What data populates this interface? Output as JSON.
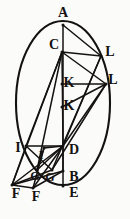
{
  "figure": {
    "kind": "geometric-diagram",
    "ink_color": "#141210",
    "paper_color": "#fbfbf9",
    "width": 130,
    "height": 219
  },
  "ellipse": {
    "cx": 63,
    "cy": 103,
    "rx": 47,
    "ry": 82
  },
  "labels": [
    {
      "id": "A",
      "text": "A",
      "x": 63,
      "y": 13,
      "size": "lg"
    },
    {
      "id": "C",
      "text": "C",
      "x": 54,
      "y": 45,
      "size": "lg"
    },
    {
      "id": "L1",
      "text": "L",
      "x": 110,
      "y": 52,
      "size": "lg"
    },
    {
      "id": "L2",
      "text": "L",
      "x": 113,
      "y": 80,
      "size": "lg"
    },
    {
      "id": "K1",
      "text": "K",
      "x": 69,
      "y": 83,
      "size": "lg"
    },
    {
      "id": "K2",
      "text": "K",
      "x": 69,
      "y": 106,
      "size": "lg"
    },
    {
      "id": "I1",
      "text": "I",
      "x": 18,
      "y": 148,
      "size": "lg"
    },
    {
      "id": "I2",
      "text": "I",
      "x": 41,
      "y": 155,
      "size": "sm"
    },
    {
      "id": "D",
      "text": "D",
      "x": 74,
      "y": 150,
      "size": "lg"
    },
    {
      "id": "G1",
      "text": "G",
      "x": 35,
      "y": 176,
      "size": "sm"
    },
    {
      "id": "G2",
      "text": "G",
      "x": 50,
      "y": 177,
      "size": "sm"
    },
    {
      "id": "B",
      "text": "B",
      "x": 74,
      "y": 177,
      "size": "lg"
    },
    {
      "id": "F1",
      "text": "F",
      "x": 16,
      "y": 194,
      "size": "lg"
    },
    {
      "id": "F2",
      "text": "F",
      "x": 36,
      "y": 197,
      "size": "lg"
    },
    {
      "id": "E",
      "text": "E",
      "x": 74,
      "y": 193,
      "size": "lg"
    }
  ],
  "points": {
    "A": {
      "x": 63,
      "y": 25
    },
    "C": {
      "x": 62,
      "y": 52
    },
    "L1": {
      "x": 101,
      "y": 56
    },
    "L2": {
      "x": 106,
      "y": 84
    },
    "K1": {
      "x": 62,
      "y": 84
    },
    "K2": {
      "x": 62,
      "y": 107
    },
    "I1": {
      "x": 26,
      "y": 146
    },
    "I2": {
      "x": 44,
      "y": 148
    },
    "D": {
      "x": 63,
      "y": 146
    },
    "G1": {
      "x": 37,
      "y": 170
    },
    "G2": {
      "x": 52,
      "y": 170
    },
    "B": {
      "x": 63,
      "y": 171
    },
    "F1": {
      "x": 12,
      "y": 185
    },
    "F2": {
      "x": 33,
      "y": 188
    },
    "E": {
      "x": 63,
      "y": 186
    }
  },
  "edges": [
    {
      "name": "axis-A-E",
      "from": "A",
      "to": "E"
    },
    {
      "name": "chord-A-L1",
      "from": "A",
      "to": "L1"
    },
    {
      "name": "chord-C-L1",
      "from": "C",
      "to": "L1"
    },
    {
      "name": "chord-C-L2",
      "from": "C",
      "to": "L2"
    },
    {
      "name": "chord-C-D",
      "from": "C",
      "to": "D"
    },
    {
      "name": "chord-C-I1",
      "from": "C",
      "to": "I1"
    },
    {
      "name": "chord-C-F1",
      "from": "C",
      "to": "F1"
    },
    {
      "name": "chord-C-G1",
      "from": "C",
      "to": "G1"
    },
    {
      "name": "chord-L1-D",
      "from": "L1",
      "to": "D"
    },
    {
      "name": "chord-L2-D",
      "from": "L2",
      "to": "D"
    },
    {
      "name": "chord-L1-G2",
      "from": "L1",
      "to": "G2"
    },
    {
      "name": "chord-L2-G2",
      "from": "L2",
      "to": "G2"
    },
    {
      "name": "seg-K1-L2",
      "from": "K1",
      "to": "L2"
    },
    {
      "name": "seg-K2-L2",
      "from": "K2",
      "to": "L2"
    },
    {
      "name": "seg-I1-D",
      "from": "I1",
      "to": "D"
    },
    {
      "name": "seg-I1-F1",
      "from": "I1",
      "to": "F1"
    },
    {
      "name": "seg-I2-F2",
      "from": "I2",
      "to": "F2"
    },
    {
      "name": "seg-F1-G2",
      "from": "F1",
      "to": "G2"
    },
    {
      "name": "seg-F1-B",
      "from": "F1",
      "to": "B"
    },
    {
      "name": "seg-F2-B",
      "from": "F2",
      "to": "B"
    },
    {
      "name": "seg-I1-G2",
      "from": "I1",
      "to": "G2"
    },
    {
      "name": "seg-I2-G1",
      "from": "I2",
      "to": "G1"
    },
    {
      "name": "seg-D-G1",
      "from": "D",
      "to": "G1"
    },
    {
      "name": "seg-D-F2",
      "from": "D",
      "to": "F2"
    },
    {
      "name": "seg-D-F1",
      "from": "D",
      "to": "F1"
    },
    {
      "name": "seg-D-B",
      "from": "D",
      "to": "B"
    },
    {
      "name": "seg-I2-D",
      "from": "I2",
      "to": "D"
    },
    {
      "name": "base-F1-F2",
      "from": "F1",
      "to": "F2"
    }
  ]
}
